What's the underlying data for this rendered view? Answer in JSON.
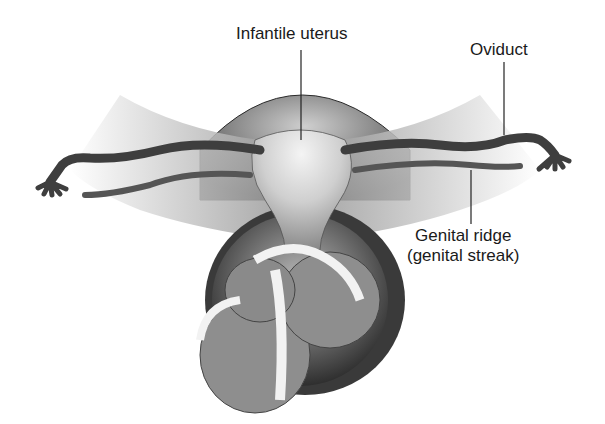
{
  "figure": {
    "labels": {
      "infantile_uterus": "Infantile uterus",
      "oviduct": "Oviduct",
      "genital_ridge_line1": "Genital ridge",
      "genital_ridge_line2": "(genital streak)"
    },
    "colors": {
      "background": "#ffffff",
      "text": "#1a1a1a",
      "dark_tissue": "#4a4a4a",
      "mid_tissue": "#8c8c8c",
      "light_tissue": "#d8d8d8",
      "highlight": "#f2f2f2"
    }
  }
}
